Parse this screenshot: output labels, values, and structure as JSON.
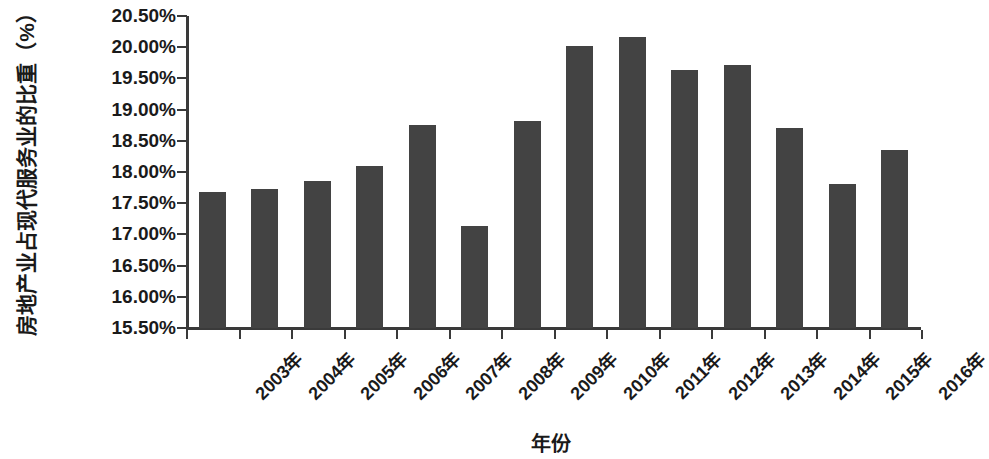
{
  "chart_data": {
    "type": "bar",
    "title": "",
    "xlabel": "年份",
    "ylabel": "房地产业占现代服务业的比重（%）",
    "categories": [
      "2003年",
      "2004年",
      "2005年",
      "2006年",
      "2007年",
      "2008年",
      "2009年",
      "2010年",
      "2011年",
      "2012年",
      "2013年",
      "2014年",
      "2015年",
      "2016年"
    ],
    "values": [
      17.68,
      17.73,
      17.85,
      18.1,
      18.76,
      17.13,
      18.82,
      20.02,
      20.17,
      19.64,
      19.72,
      18.7,
      17.81,
      18.36
    ],
    "value_labels": [
      "17.68%",
      "17.73%",
      "17.85%",
      "18.10%",
      "18.76%",
      "17.13%",
      "18.82%",
      "20.02%",
      "20.17%",
      "19.64%",
      "19.72%",
      "18.70%",
      "17.81%",
      "18.36%"
    ],
    "ylim": [
      15.5,
      20.5
    ],
    "ytick_values": [
      20.5,
      20.0,
      19.5,
      19.0,
      18.5,
      18.0,
      17.5,
      17.0,
      16.5,
      16.0,
      15.5
    ],
    "ytick_labels": [
      "20.50%",
      "20.00%",
      "19.50%",
      "19.00%",
      "18.50%",
      "18.00%",
      "17.50%",
      "17.00%",
      "16.50%",
      "16.00%",
      "15.50%"
    ],
    "grid": false,
    "legend": null,
    "series_color": "#434343",
    "axis_color": "#3a3a3a",
    "background": "#ffffff"
  }
}
